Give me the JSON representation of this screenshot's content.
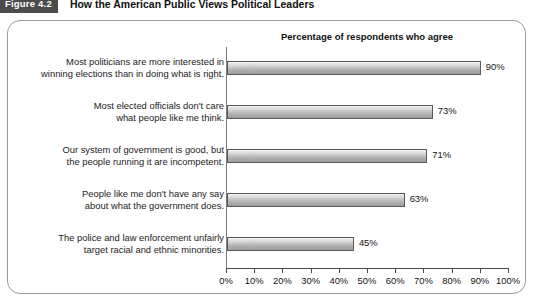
{
  "figure": {
    "badge": "Figure 4.2",
    "title": "How the American Public Views Political Leaders"
  },
  "chart_data": {
    "type": "bar",
    "orientation": "horizontal",
    "title": "Percentage of respondents who agree",
    "xlabel": "",
    "ylabel": "",
    "xlim": [
      0,
      100
    ],
    "grid": false,
    "legend": null,
    "tick_labels": [
      "0%",
      "10%",
      "20%",
      "30%",
      "40%",
      "50%",
      "60%",
      "70%",
      "80%",
      "90%",
      "100%"
    ],
    "tick_values": [
      0,
      10,
      20,
      30,
      40,
      50,
      60,
      70,
      80,
      90,
      100
    ],
    "categories": [
      "Most politicians are more interested in winning elections than in doing what is right.",
      "Most elected officials don't care what people like me think.",
      "Our system of government is good, but the people running it are incompetent.",
      "People like me don't have any say about what the government does.",
      "The police and law enforcement unfairly target racial and ethnic minorities."
    ],
    "values": [
      90,
      73,
      71,
      63,
      45
    ],
    "value_labels": [
      "90%",
      "73%",
      "71%",
      "63%",
      "45%"
    ],
    "bars": [
      {
        "line1": "Most politicians are more interested in",
        "line2": "winning elections than in doing what is right.",
        "value": 90,
        "value_label": "90%"
      },
      {
        "line1": "Most elected officials don't care",
        "line2": "what people like me think.",
        "value": 73,
        "value_label": "73%"
      },
      {
        "line1": "Our system of government is good, but",
        "line2": "the people running it are incompetent.",
        "value": 71,
        "value_label": "71%"
      },
      {
        "line1": "People like me don't have any say",
        "line2": "about what the government does.",
        "value": 63,
        "value_label": "63%"
      },
      {
        "line1": "The police and law enforcement unfairly",
        "line2": "target racial and ethnic minorities.",
        "value": 45,
        "value_label": "45%"
      }
    ]
  },
  "colors": {
    "badge_background": "#4c4c4c",
    "badge_text": "#ffffff",
    "panel_border": "#9b9b9b",
    "bar_border": "#5a5a5a",
    "bar_fill_light": "#f2f2f2",
    "bar_fill_dark": "#9d9d9d",
    "axis": "#4a4a4a",
    "text": "#111111"
  }
}
